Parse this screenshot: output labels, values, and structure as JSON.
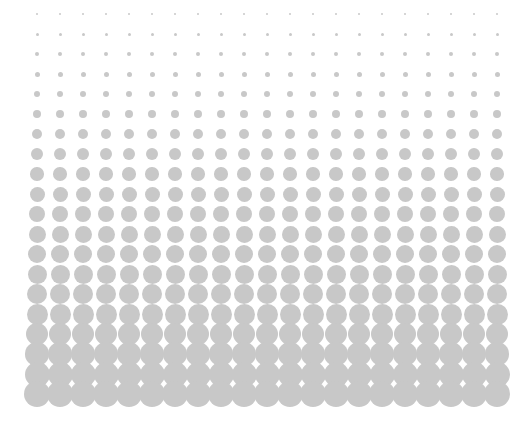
{
  "pattern": {
    "type": "halftone-dot-gradient",
    "dot_color": "#c8c8c8",
    "background_color": "#ffffff",
    "columns": 21,
    "rows": 20,
    "origin_x": 37,
    "origin_y": 14,
    "step_x": 23,
    "step_y": 20,
    "row_diameters": [
      2,
      3,
      4,
      5,
      6.5,
      8,
      10,
      12,
      13.5,
      15,
      16,
      17,
      18,
      19,
      20,
      21,
      22,
      23.5,
      25,
      26
    ]
  }
}
